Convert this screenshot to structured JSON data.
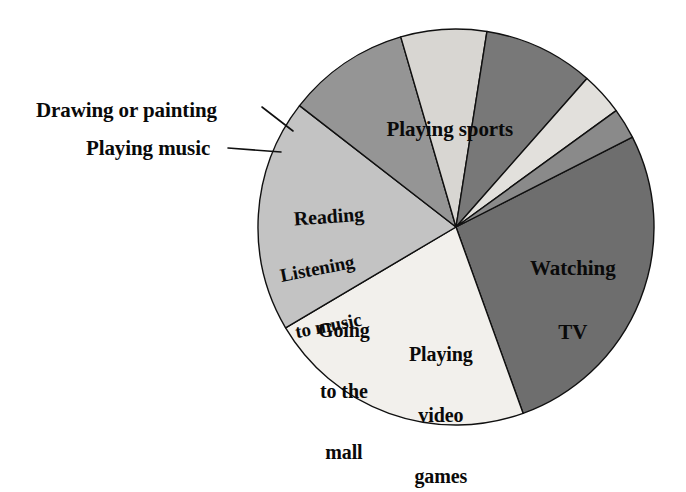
{
  "chart_data": {
    "type": "pie",
    "title": "",
    "subtitle": "",
    "xlabel": "",
    "ylabel": "",
    "legend_position": "none",
    "grid": false,
    "labels_placement": "inside-slices-with-leader-lines-for-thin-slices",
    "start_angle_deg": -27,
    "direction": "clockwise",
    "categories": [
      "Playing sports",
      "Watching TV",
      "Playing video games",
      "Going to the mall",
      "Listening to music",
      "Reading",
      "Playing music",
      "Drawing or painting"
    ],
    "values": [
      27,
      22,
      19,
      10,
      7,
      9,
      3.5,
      2.5
    ],
    "units": "percent",
    "slices": [
      {
        "label": "Playing sports",
        "value": 27,
        "color": "#6e6e6e",
        "label_lines": [
          "Playing sports"
        ],
        "label_inside": true
      },
      {
        "label": "Watching TV",
        "value": 22,
        "color": "#f2f0ec",
        "label_lines": [
          "Watching",
          "TV"
        ],
        "label_inside": true
      },
      {
        "label": "Playing video games",
        "value": 19,
        "color": "#c3c3c3",
        "label_lines": [
          "Playing",
          "video",
          "games"
        ],
        "label_inside": true
      },
      {
        "label": "Going to the mall",
        "value": 10,
        "color": "#959595",
        "label_lines": [
          "Going",
          "to the",
          "mall"
        ],
        "label_inside": true
      },
      {
        "label": "Listening to music",
        "value": 7,
        "color": "#d8d6d2",
        "label_lines": [
          "Listening",
          "to music"
        ],
        "label_inside": true
      },
      {
        "label": "Reading",
        "value": 9,
        "color": "#787878",
        "label_lines": [
          "Reading"
        ],
        "label_inside": true
      },
      {
        "label": "Playing music",
        "value": 3.5,
        "color": "#e2e0dc",
        "label_lines": [
          "Playing music"
        ],
        "label_inside": false
      },
      {
        "label": "Drawing or painting",
        "value": 2.5,
        "color": "#8a8a8a",
        "label_lines": [
          "Drawing or painting"
        ],
        "label_inside": false
      }
    ]
  },
  "labels": {
    "playing_sports": "Playing sports",
    "watching_tv_line1": "Watching",
    "watching_tv_line2": "TV",
    "video_games_line1": "Playing",
    "video_games_line2": "video",
    "video_games_line3": "games",
    "mall_line1": "Going",
    "mall_line2": "to the",
    "mall_line3": "mall",
    "listening_line1": "Listening",
    "listening_line2": "to music",
    "reading": "Reading",
    "drawing_or_painting": "Drawing or painting",
    "playing_music": "Playing music"
  },
  "colors": {
    "background": "#ffffff",
    "outline": "#101010",
    "text": "#0a0a0a",
    "playing_sports": "#6e6e6e",
    "watching_tv": "#f2f0ec",
    "playing_video_games": "#c3c3c3",
    "going_to_the_mall": "#959595",
    "listening_to_music": "#d8d6d2",
    "reading": "#787878",
    "playing_music": "#e2e0dc",
    "drawing_or_painting": "#8a8a8a"
  },
  "geometry": {
    "center_x": 456,
    "center_y": 227,
    "radius": 198
  }
}
